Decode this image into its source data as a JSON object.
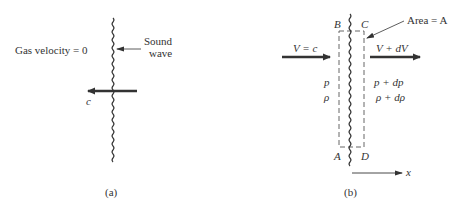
{
  "panel_a": {
    "gas_velocity_label": "Gas velocity = 0",
    "sound_wave_label_line1": "Sound",
    "sound_wave_label_line2": "wave",
    "wave_speed_label": "c",
    "caption": "(a)"
  },
  "panel_b": {
    "corner_b": "B",
    "corner_c": "C",
    "corner_a": "A",
    "corner_d": "D",
    "area_label": "Area = A",
    "inflow_velocity_label": "V = c",
    "outflow_velocity_label": "V + dV",
    "upstream_pressure": "p",
    "upstream_density": "ρ",
    "downstream_pressure": "p + dp",
    "downstream_density": "ρ + dρ",
    "axis_label": "x",
    "caption": "(b)"
  },
  "colors": {
    "stroke": "#333333",
    "dashed": "#555555",
    "background": "#ffffff"
  }
}
